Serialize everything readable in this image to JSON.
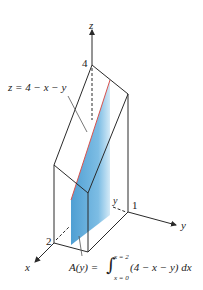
{
  "diagram": {
    "axes": {
      "x_label": "x",
      "y_label": "y",
      "z_label": "z"
    },
    "ticks": {
      "z_tick": "4",
      "x_tick": "2",
      "y_tick": "1",
      "y_slice_label": "y"
    },
    "surface_label": "z = 4 − x − y",
    "area_formula": {
      "lhs": "A(y) =",
      "upper_limit": "x = 2",
      "lower_limit": "x = 0",
      "integrand": "(4 − x − y) dx"
    },
    "colors": {
      "line": "#2a2a2a",
      "cross_section_fill": "#5aa7d6",
      "cross_section_light": "#cfe6f5",
      "cross_section_edge": "#d9534f"
    }
  }
}
